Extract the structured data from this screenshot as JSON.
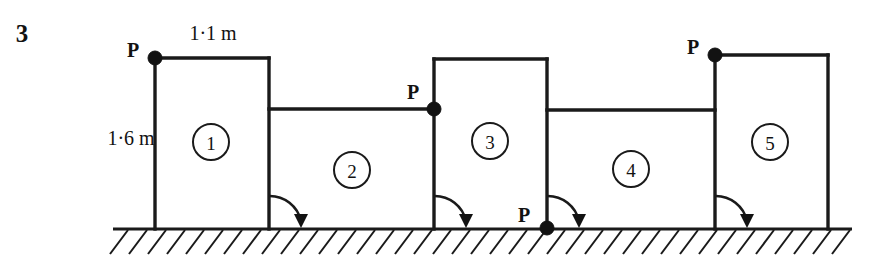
{
  "figure": {
    "question_number": "3",
    "dimensions": {
      "width_label": "1·1 m",
      "height_label": "1·6 m"
    },
    "members": [
      {
        "id": "member-1",
        "label": "1",
        "cx": 211,
        "cy": 142,
        "r": 18
      },
      {
        "id": "member-2",
        "label": "2",
        "cx": 352,
        "cy": 170,
        "r": 18
      },
      {
        "id": "member-3",
        "label": "3",
        "cx": 490,
        "cy": 141,
        "r": 18
      },
      {
        "id": "member-4",
        "label": "4",
        "cx": 631,
        "cy": 169,
        "r": 18
      },
      {
        "id": "member-5",
        "label": "5",
        "cx": 770,
        "cy": 142,
        "r": 18
      }
    ],
    "hinges": [
      {
        "id": "hinge-top-left",
        "label": "P",
        "cx": 155,
        "cy": 58,
        "r": 7,
        "label_x": 133,
        "label_y": 50
      },
      {
        "id": "hinge-beam-mid",
        "label": "P",
        "cx": 434,
        "cy": 109,
        "r": 7,
        "label_x": 413,
        "label_y": 92
      },
      {
        "id": "hinge-ground-mid",
        "label": "P",
        "cx": 547,
        "cy": 228,
        "r": 7,
        "label_x": 524,
        "label_y": 215
      },
      {
        "id": "hinge-top-right",
        "label": "P",
        "cx": 715,
        "cy": 55,
        "r": 7,
        "label_x": 693,
        "label_y": 47
      }
    ],
    "rotation_arrows": [
      {
        "id": "rotation-arrow-1",
        "pivot_x": 269,
        "pivot_y": 228,
        "radius": 32
      },
      {
        "id": "rotation-arrow-2",
        "pivot_x": 434,
        "pivot_y": 228,
        "radius": 32
      },
      {
        "id": "rotation-arrow-3",
        "pivot_x": 547,
        "pivot_y": 228,
        "radius": 32
      },
      {
        "id": "rotation-arrow-4",
        "pivot_x": 715,
        "pivot_y": 228,
        "radius": 32
      }
    ],
    "ground": {
      "line_start_x": 113,
      "line_end_x": 852,
      "line_y": 229,
      "hatch_count": 39,
      "hatch_start_x": 128,
      "hatch_spacing": 19,
      "hatch_dx": -18,
      "hatch_dy": 24
    },
    "frame_segments": [
      {
        "id": "block1-left-column",
        "x1": 155,
        "y1": 58,
        "x2": 155,
        "y2": 229
      },
      {
        "id": "block1-top-beam",
        "x1": 155,
        "y1": 58,
        "x2": 269,
        "y2": 58
      },
      {
        "id": "block1-right-column",
        "x1": 269,
        "y1": 58,
        "x2": 269,
        "y2": 229
      },
      {
        "id": "beam-2",
        "x1": 269,
        "y1": 109,
        "x2": 434,
        "y2": 109
      },
      {
        "id": "block3-left-column",
        "x1": 434,
        "y1": 59,
        "x2": 434,
        "y2": 229
      },
      {
        "id": "block3-top-beam",
        "x1": 434,
        "y1": 59,
        "x2": 547,
        "y2": 59
      },
      {
        "id": "block3-right-column",
        "x1": 547,
        "y1": 59,
        "x2": 547,
        "y2": 229
      },
      {
        "id": "beam-4",
        "x1": 547,
        "y1": 110,
        "x2": 715,
        "y2": 110
      },
      {
        "id": "block5-left-column",
        "x1": 715,
        "y1": 55,
        "x2": 715,
        "y2": 229
      },
      {
        "id": "block5-top-beam",
        "x1": 715,
        "y1": 55,
        "x2": 828,
        "y2": 55
      },
      {
        "id": "block5-right-column",
        "x1": 828,
        "y1": 55,
        "x2": 828,
        "y2": 229
      }
    ],
    "labels": {
      "question_number_x": 22,
      "question_number_y": 33,
      "width_label_x": 213,
      "width_label_y": 33,
      "height_label_x": 131,
      "height_label_y": 138
    }
  }
}
